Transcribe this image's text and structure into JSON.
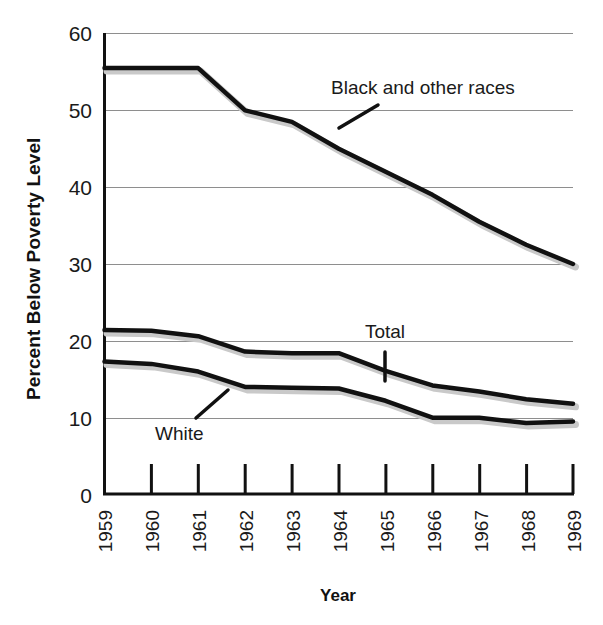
{
  "chart_data": {
    "type": "line",
    "title": "",
    "xlabel": "Year",
    "ylabel": "Percent Below Poverty Level",
    "categories": [
      "1959",
      "1960",
      "1961",
      "1962",
      "1963",
      "1964",
      "1965",
      "1966",
      "1967",
      "1968",
      "1969"
    ],
    "x": [
      1959,
      1960,
      1961,
      1962,
      1963,
      1964,
      1965,
      1966,
      1967,
      1968,
      1969
    ],
    "xlim": [
      1959,
      1969
    ],
    "ylim": [
      0,
      60
    ],
    "yticks": [
      0,
      10,
      20,
      30,
      40,
      50,
      60
    ],
    "ytick_labels": [
      "0",
      "10",
      "20",
      "30",
      "40",
      "50",
      "60"
    ],
    "grid": "horizontal",
    "legend": "inline-annotations",
    "series": [
      {
        "name": "Black and other races",
        "values": [
          55.5,
          55.5,
          55.5,
          50.0,
          48.5,
          45.0,
          42.0,
          39.0,
          35.5,
          32.5,
          30.0
        ],
        "color": "#111111"
      },
      {
        "name": "Total",
        "values": [
          21.4,
          21.3,
          20.6,
          18.6,
          18.4,
          18.4,
          16.1,
          14.2,
          13.4,
          12.4,
          11.8
        ],
        "color": "#111111"
      },
      {
        "name": "White",
        "values": [
          17.3,
          17.0,
          16.0,
          14.0,
          13.9,
          13.8,
          12.2,
          10.0,
          10.0,
          9.3,
          9.5
        ],
        "color": "#111111"
      }
    ],
    "annotations": [
      {
        "text": "Black and other races",
        "series": "Black and other races"
      },
      {
        "text": "Total",
        "series": "Total"
      },
      {
        "text": "White",
        "series": "White"
      }
    ],
    "colors": {
      "line": "#111111",
      "shadow": "#c9c9c9",
      "grid": "#8e8e8e",
      "axis": "#111111",
      "text": "#1a1a1a",
      "background": "#ffffff"
    }
  },
  "labels": {
    "y_axis_title": "Percent Below Poverty Level",
    "x_axis_title": "Year",
    "annotation_black": "Black and other races",
    "annotation_total": "Total",
    "annotation_white": "White",
    "ytick_0": "0",
    "ytick_10": "10",
    "ytick_20": "20",
    "ytick_30": "30",
    "ytick_40": "40",
    "ytick_50": "50",
    "ytick_60": "60",
    "xtick_1959": "1959",
    "xtick_1960": "1960",
    "xtick_1961": "1961",
    "xtick_1962": "1962",
    "xtick_1963": "1963",
    "xtick_1964": "1964",
    "xtick_1965": "1965",
    "xtick_1966": "1966",
    "xtick_1967": "1967",
    "xtick_1968": "1968",
    "xtick_1969": "1969"
  }
}
